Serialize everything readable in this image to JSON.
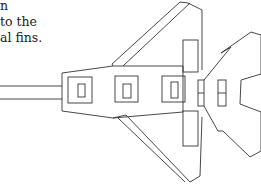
{
  "caption": {
    "lines": [
      "n",
      "to the",
      "al fins."
    ]
  },
  "figure": {
    "stroke_color": "#333333"
  }
}
